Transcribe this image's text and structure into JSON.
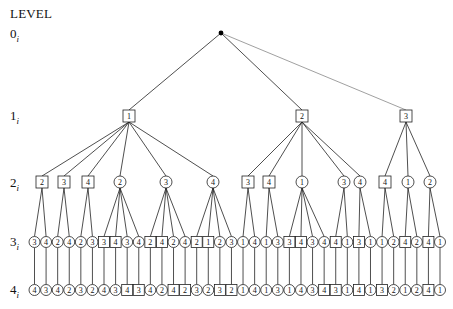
{
  "diagram": {
    "title": "LEVEL",
    "levels": [
      {
        "num": "0",
        "sub": "i",
        "y": 34
      },
      {
        "num": "1",
        "sub": "i",
        "y": 116
      },
      {
        "num": "2",
        "sub": "i",
        "y": 183
      },
      {
        "num": "3",
        "sub": "i",
        "y": 242
      },
      {
        "num": "4",
        "sub": "i",
        "y": 290
      }
    ],
    "root": {
      "x": 221,
      "y": 33
    },
    "level1": [
      {
        "label": "1",
        "shape": "square",
        "x": 129
      },
      {
        "label": "2",
        "shape": "square",
        "x": 302
      },
      {
        "label": "3",
        "shape": "square",
        "x": 406
      }
    ],
    "level2": [
      {
        "label": "2",
        "shape": "square",
        "x": 42,
        "parent": 0
      },
      {
        "label": "3",
        "shape": "square",
        "x": 64,
        "parent": 0
      },
      {
        "label": "4",
        "shape": "square",
        "x": 88,
        "parent": 0
      },
      {
        "label": "2",
        "shape": "circle",
        "x": 120,
        "parent": 0
      },
      {
        "label": "3",
        "shape": "circle",
        "x": 166,
        "parent": 0
      },
      {
        "label": "4",
        "shape": "circle",
        "x": 213,
        "parent": 0
      },
      {
        "label": "3",
        "shape": "square",
        "x": 248,
        "parent": 1
      },
      {
        "label": "4",
        "shape": "square",
        "x": 269,
        "parent": 1
      },
      {
        "label": "1",
        "shape": "circle",
        "x": 302,
        "parent": 1
      },
      {
        "label": "3",
        "shape": "circle",
        "x": 344,
        "parent": 1
      },
      {
        "label": "4",
        "shape": "circle",
        "x": 360,
        "parent": 1
      },
      {
        "label": "4",
        "shape": "square",
        "x": 385,
        "parent": 2
      },
      {
        "label": "1",
        "shape": "circle",
        "x": 408,
        "parent": 2
      },
      {
        "label": "2",
        "shape": "circle",
        "x": 430,
        "parent": 2
      }
    ],
    "level3": [
      {
        "label": "3",
        "shape": "circle",
        "parent": 0
      },
      {
        "label": "4",
        "shape": "circle",
        "parent": 0
      },
      {
        "label": "2",
        "shape": "circle",
        "parent": 1
      },
      {
        "label": "4",
        "shape": "circle",
        "parent": 1
      },
      {
        "label": "2",
        "shape": "circle",
        "parent": 2
      },
      {
        "label": "3",
        "shape": "circle",
        "parent": 2
      },
      {
        "label": "3",
        "shape": "square",
        "parent": 3
      },
      {
        "label": "4",
        "shape": "square",
        "parent": 3
      },
      {
        "label": "3",
        "shape": "circle",
        "parent": 3
      },
      {
        "label": "4",
        "shape": "circle",
        "parent": 3
      },
      {
        "label": "2",
        "shape": "square",
        "parent": 4
      },
      {
        "label": "4",
        "shape": "square",
        "parent": 4
      },
      {
        "label": "2",
        "shape": "circle",
        "parent": 4
      },
      {
        "label": "4",
        "shape": "circle",
        "parent": 4
      },
      {
        "label": "2",
        "shape": "square",
        "parent": 5
      },
      {
        "label": "1",
        "shape": "square",
        "parent": 5
      },
      {
        "label": "2",
        "shape": "circle",
        "parent": 5
      },
      {
        "label": "3",
        "shape": "circle",
        "parent": 5
      },
      {
        "label": "1",
        "shape": "circle",
        "parent": 6
      },
      {
        "label": "4",
        "shape": "circle",
        "parent": 6
      },
      {
        "label": "1",
        "shape": "circle",
        "parent": 7
      },
      {
        "label": "3",
        "shape": "circle",
        "parent": 7
      },
      {
        "label": "3",
        "shape": "square",
        "parent": 8
      },
      {
        "label": "4",
        "shape": "square",
        "parent": 8
      },
      {
        "label": "3",
        "shape": "circle",
        "parent": 8
      },
      {
        "label": "4",
        "shape": "circle",
        "parent": 8
      },
      {
        "label": "4",
        "shape": "square",
        "parent": 9
      },
      {
        "label": "1",
        "shape": "circle",
        "parent": 9
      },
      {
        "label": "3",
        "shape": "square",
        "parent": 10
      },
      {
        "label": "1",
        "shape": "circle",
        "parent": 10
      },
      {
        "label": "1",
        "shape": "circle",
        "parent": 11
      },
      {
        "label": "2",
        "shape": "circle",
        "parent": 11
      },
      {
        "label": "4",
        "shape": "square",
        "parent": 12
      },
      {
        "label": "2",
        "shape": "circle",
        "parent": 12
      },
      {
        "label": "4",
        "shape": "square",
        "parent": 13
      },
      {
        "label": "1",
        "shape": "circle",
        "parent": 13
      }
    ],
    "level4": [
      {
        "label": "4",
        "shape": "circle"
      },
      {
        "label": "3",
        "shape": "circle"
      },
      {
        "label": "4",
        "shape": "circle"
      },
      {
        "label": "2",
        "shape": "circle"
      },
      {
        "label": "3",
        "shape": "circle"
      },
      {
        "label": "2",
        "shape": "circle"
      },
      {
        "label": "4",
        "shape": "circle"
      },
      {
        "label": "3",
        "shape": "circle"
      },
      {
        "label": "4",
        "shape": "square"
      },
      {
        "label": "3",
        "shape": "square"
      },
      {
        "label": "4",
        "shape": "circle"
      },
      {
        "label": "2",
        "shape": "circle"
      },
      {
        "label": "4",
        "shape": "square"
      },
      {
        "label": "2",
        "shape": "square"
      },
      {
        "label": "3",
        "shape": "circle"
      },
      {
        "label": "2",
        "shape": "circle"
      },
      {
        "label": "3",
        "shape": "square"
      },
      {
        "label": "2",
        "shape": "square"
      },
      {
        "label": "1",
        "shape": "circle"
      },
      {
        "label": "4",
        "shape": "circle"
      },
      {
        "label": "1",
        "shape": "circle"
      },
      {
        "label": "3",
        "shape": "circle"
      },
      {
        "label": "1",
        "shape": "circle"
      },
      {
        "label": "4",
        "shape": "circle"
      },
      {
        "label": "3",
        "shape": "circle"
      },
      {
        "label": "4",
        "shape": "square"
      },
      {
        "label": "3",
        "shape": "square"
      },
      {
        "label": "1",
        "shape": "circle"
      },
      {
        "label": "4",
        "shape": "square"
      },
      {
        "label": "1",
        "shape": "circle"
      },
      {
        "label": "3",
        "shape": "square"
      },
      {
        "label": "2",
        "shape": "circle"
      },
      {
        "label": "1",
        "shape": "circle"
      },
      {
        "label": "2",
        "shape": "circle"
      },
      {
        "label": "4",
        "shape": "square"
      },
      {
        "label": "1",
        "shape": "circle"
      }
    ],
    "colors": {
      "stroke": "#222222",
      "fill": "#ffffff",
      "text": "#111111",
      "light_edge": "#888888"
    }
  }
}
